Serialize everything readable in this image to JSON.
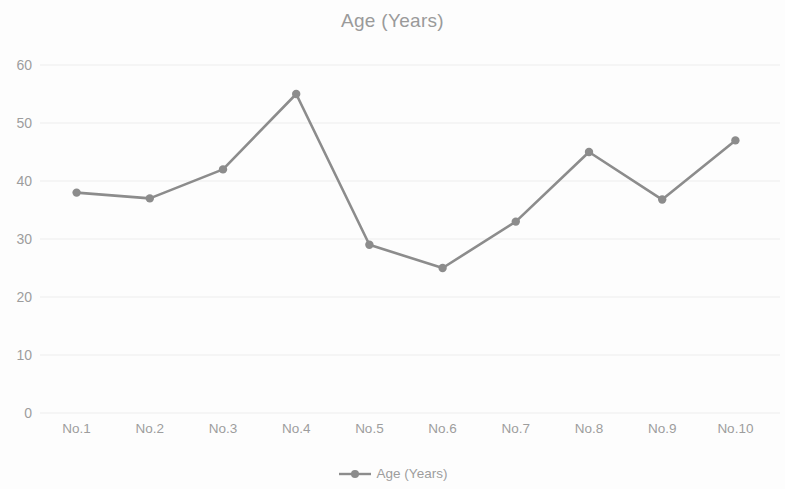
{
  "chart_data": {
    "type": "line",
    "title": "Age (Years)",
    "xlabel": "",
    "ylabel": "",
    "categories": [
      "No.1",
      "No.2",
      "No.3",
      "No.4",
      "No.5",
      "No.6",
      "No.7",
      "No.8",
      "No.9",
      "No.10"
    ],
    "series": [
      {
        "name": "Age (Years)",
        "values": [
          38,
          37,
          42,
          55,
          29,
          25,
          33,
          45,
          36.8,
          47
        ],
        "color": "#8c8c8c",
        "marker": "circle"
      }
    ],
    "ylim": [
      0,
      60
    ],
    "ytick_labels": [
      "0",
      "10",
      "20",
      "30",
      "40",
      "50",
      "60"
    ],
    "ytick_values": [
      0,
      10,
      20,
      30,
      40,
      50,
      60
    ],
    "grid": true,
    "grid_axis": "y",
    "grid_color": "#ededed",
    "legend_position": "bottom",
    "legend_entries": [
      "Age (Years)"
    ],
    "background_color": "#fdfdfd",
    "text_color": "#9d9d9d"
  },
  "legend": {
    "marker_icon": "line-marker-icon"
  }
}
